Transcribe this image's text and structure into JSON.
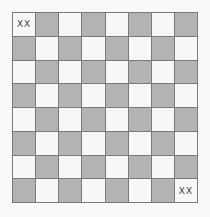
{
  "board": {
    "rows": 8,
    "cols": 8,
    "colors": {
      "light": "#f7f7f7",
      "dark": "#b3b3b3",
      "grid": "#7a7a7a"
    },
    "top_left_is_light": true,
    "markers": [
      {
        "row": 0,
        "col": 0,
        "label": "XX"
      },
      {
        "row": 7,
        "col": 7,
        "label": "XX"
      }
    ]
  }
}
